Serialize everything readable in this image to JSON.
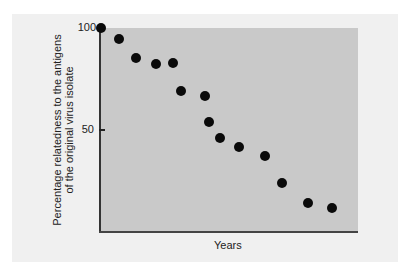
{
  "chart_data": {
    "type": "scatter",
    "title": "",
    "xlabel": "Years",
    "ylabel": "Percentage relatedness to the antigens of the original virus isolate",
    "ylabel_lines": [
      "Percentage relatedness to the antigens",
      "of the original virus isolate"
    ],
    "yticks": [
      {
        "value": 100,
        "label": "100"
      },
      {
        "value": 50,
        "label": "50"
      }
    ],
    "xticks": [],
    "ylim": [
      0,
      100
    ],
    "grid": false,
    "legend": null,
    "points": [
      {
        "x": 1,
        "y": 100
      },
      {
        "x": 2,
        "y": 95
      },
      {
        "x": 3,
        "y": 85
      },
      {
        "x": 4,
        "y": 82
      },
      {
        "x": 5,
        "y": 82
      },
      {
        "x": 5.5,
        "y": 69
      },
      {
        "x": 7,
        "y": 67
      },
      {
        "x": 7.2,
        "y": 54
      },
      {
        "x": 7.8,
        "y": 46
      },
      {
        "x": 8.9,
        "y": 42
      },
      {
        "x": 10.3,
        "y": 37
      },
      {
        "x": 11.3,
        "y": 24
      },
      {
        "x": 12.7,
        "y": 14
      },
      {
        "x": 14,
        "y": 11
      }
    ],
    "point_pixels": [
      [
        101,
        28
      ],
      [
        119,
        39
      ],
      [
        136,
        58
      ],
      [
        156,
        64
      ],
      [
        173,
        63
      ],
      [
        181,
        91
      ],
      [
        205,
        96
      ],
      [
        209,
        122
      ],
      [
        220,
        138
      ],
      [
        239,
        147
      ],
      [
        265,
        156
      ],
      [
        282,
        183
      ],
      [
        308,
        203
      ],
      [
        332,
        208
      ]
    ],
    "colors": {
      "panel_background": "#f0f0f0",
      "plot_background": "#c9c9c9",
      "points": "#0a0a0a",
      "axes": "#333333"
    }
  }
}
